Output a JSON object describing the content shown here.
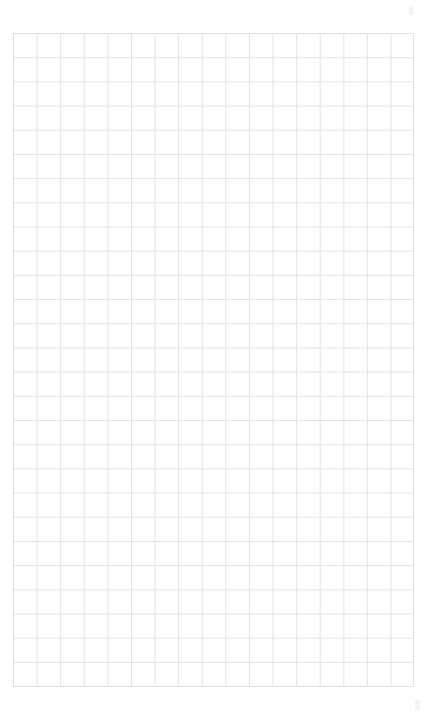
{
  "canvas": {
    "name": "blank-grid-canvas",
    "width": 430,
    "height": 717,
    "background_color": "#ffffff",
    "content_text": "",
    "note": ""
  },
  "grid": {
    "label": "",
    "line_color": "#e3e3e6",
    "border_color": "#e0e0e3",
    "cell_width": 23.6,
    "cell_height": 24.2,
    "columns": 17,
    "rows": 27,
    "offset_x": 13,
    "offset_y": 33,
    "width": 401,
    "height": 654
  },
  "artifacts": [
    {
      "name": "corner-speck-top-right",
      "x": 409,
      "y": 6,
      "width": 4,
      "height": 9
    },
    {
      "name": "corner-speck-bottom-right",
      "x": 415,
      "y": 700,
      "width": 5,
      "height": 10
    }
  ]
}
